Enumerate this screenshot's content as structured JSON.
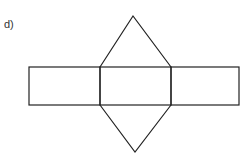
{
  "figure": {
    "label": "d)",
    "stroke_color": "#222222",
    "background": "#ffffff",
    "shapes": {
      "rectangles": [
        {
          "name": "left-face",
          "x": 29,
          "y": 67,
          "w": 71,
          "h": 38
        },
        {
          "name": "middle-face",
          "x": 100,
          "y": 67,
          "w": 71,
          "h": 38
        },
        {
          "name": "right-face",
          "x": 171,
          "y": 67,
          "w": 68,
          "h": 38
        }
      ],
      "triangles": [
        {
          "name": "top-triangle",
          "points": "100,67 133,16 171,67"
        },
        {
          "name": "bottom-triangle",
          "points": "100,105 135,152 171,105"
        }
      ]
    }
  }
}
